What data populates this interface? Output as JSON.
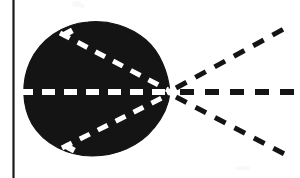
{
  "figure": {
    "kind": "technical-illustration",
    "background_color": "#ffffff",
    "ink_color": "#141414",
    "canvas": {
      "width": 300,
      "height": 178
    },
    "margin_rule": {
      "name": "left vertical rule",
      "orientation": "vertical",
      "x": 13.5,
      "y_start": 0,
      "y_end": 178,
      "stroke_width": 2.2,
      "color": "#1a1a1a"
    },
    "lobe": {
      "name": "solid black lobe",
      "fill": "#141414",
      "description": "large filled rounded lobe, nearly circular on the left, tapering to a sharp point at the right",
      "bounds": {
        "left": 23,
        "top": 22,
        "right": 172,
        "bottom": 156
      },
      "apex": {
        "x": 170,
        "y": 92
      },
      "center": {
        "x": 92,
        "y": 90
      },
      "radius_x": 70,
      "radius_y": 67,
      "outline_path": "M 170 92 C 168 72 160 52 146 40 C 130 26 108 20 88 22 C 62 24 40 40 30 62 C 21 82 22 106 32 124 C 44 144 68 156 92 156 C 116 156 140 146 154 128 C 164 116 169 104 170 92 Z"
    },
    "vertex": {
      "name": "convergence vertex",
      "x": 170,
      "y": 92,
      "label": "",
      "description": "point where the three interior white dashed lines and the three exterior black dashed rays meet"
    },
    "interior_dashed_lines": [
      {
        "name": "upper interior chord",
        "color": "#ffffff",
        "from": {
          "x": 60,
          "y": 33
        },
        "to": {
          "x": 168,
          "y": 90
        },
        "stroke_width": 5,
        "dash": "11 9"
      },
      {
        "name": "axis chord",
        "color": "#ffffff",
        "from": {
          "x": 20,
          "y": 92
        },
        "to": {
          "x": 168,
          "y": 92
        },
        "stroke_width": 6,
        "dash": "13 9"
      },
      {
        "name": "lower interior chord",
        "color": "#ffffff",
        "from": {
          "x": 62,
          "y": 148
        },
        "to": {
          "x": 168,
          "y": 95
        },
        "stroke_width": 5,
        "dash": "11 9"
      }
    ],
    "exterior_dashed_rays": [
      {
        "name": "upper ray",
        "color": "#141414",
        "from": {
          "x": 176,
          "y": 88
        },
        "to": {
          "x": 291,
          "y": 25
        },
        "stroke_width": 5,
        "dash": "12 10",
        "direction": "up-right"
      },
      {
        "name": "horizontal ray",
        "color": "#141414",
        "from": {
          "x": 180,
          "y": 92
        },
        "to": {
          "x": 295,
          "y": 92
        },
        "stroke_width": 6,
        "dash": "14 11",
        "direction": "right"
      },
      {
        "name": "lower ray",
        "color": "#141414",
        "from": {
          "x": 176,
          "y": 97
        },
        "to": {
          "x": 292,
          "y": 158
        },
        "stroke_width": 5,
        "dash": "12 10",
        "direction": "down-right"
      }
    ],
    "edge_notches": [
      {
        "name": "top-left boundary notch",
        "x": 62,
        "y": 30,
        "width": 11,
        "height": 6,
        "rotation": -28
      },
      {
        "name": "bottom-left boundary notch",
        "x": 64,
        "y": 145,
        "width": 11,
        "height": 6,
        "rotation": 28
      }
    ],
    "scan_artifacts": [
      {
        "name": "top smudge",
        "x": 72,
        "y": 1
      },
      {
        "name": "top smudge secondary",
        "x": 80,
        "y": 4
      },
      {
        "name": "bottom smudge",
        "x": 236,
        "y": 166
      }
    ]
  }
}
